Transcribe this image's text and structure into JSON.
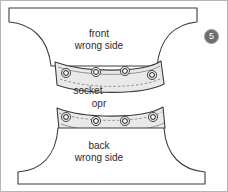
{
  "figure": {
    "step_badge": "5",
    "frame_color": "#b5b5b5",
    "outline_color": "#3c3c3c",
    "band_fill": "#e9e9e9",
    "text_color": "#2b2b2b",
    "badge_bg": "#6e6e6e",
    "badge_text_color": "#ffffff"
  },
  "labels": {
    "front_line1": "front",
    "front_line2": "wrong side",
    "socket": "socket",
    "opr": "opr",
    "back_line1": "back",
    "back_line2": "wrong side"
  },
  "pieces": {
    "front_panel": "front panel wrong side",
    "back_panel": "back panel wrong side",
    "socket_band": "socket band with eyelets",
    "opr_band": "opr band with eyelets"
  },
  "eyelets": {
    "socket_band_count": 4,
    "opr_band_count": 4
  }
}
